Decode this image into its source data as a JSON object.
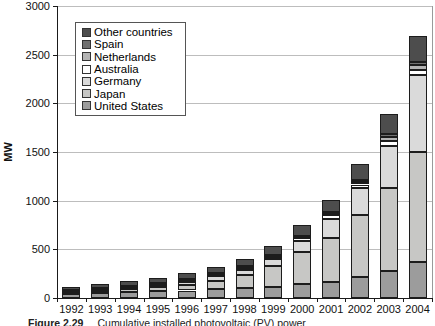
{
  "chart_data": {
    "type": "bar",
    "variant": "stacked-vertical",
    "title": "",
    "xlabel": "",
    "ylabel": "MW",
    "ylim": [
      0,
      3000
    ],
    "yticks": [
      0,
      500,
      1000,
      1500,
      2000,
      2500,
      3000
    ],
    "grid": "horizontal",
    "categories": [
      "1992",
      "1993",
      "1994",
      "1995",
      "1996",
      "1997",
      "1998",
      "1999",
      "2000",
      "2001",
      "2002",
      "2003",
      "2004"
    ],
    "series": [
      {
        "name": "United States",
        "color": "#9c9c9c",
        "values": [
          44,
          50,
          58,
          67,
          77,
          88,
          100,
          117,
          139,
          168,
          212,
          275,
          365
        ]
      },
      {
        "name": "Japan",
        "color": "#c7c7c5",
        "values": [
          19,
          24,
          31,
          43,
          60,
          91,
          133,
          209,
          330,
          453,
          637,
          860,
          1132
        ]
      },
      {
        "name": "Germany",
        "color": "#dadada",
        "values": [
          6,
          9,
          12,
          18,
          28,
          42,
          54,
          70,
          114,
          195,
          278,
          431,
          794
        ]
      },
      {
        "name": "Australia",
        "color": "#ffffff",
        "values": [
          7,
          9,
          11,
          13,
          16,
          19,
          23,
          25,
          29,
          34,
          39,
          46,
          52
        ]
      },
      {
        "name": "Netherlands",
        "color": "#b3b3b3",
        "values": [
          1,
          2,
          2,
          2,
          3,
          4,
          7,
          9,
          13,
          21,
          26,
          46,
          49
        ]
      },
      {
        "name": "Spain",
        "color": "#707070",
        "values": [
          4,
          5,
          6,
          7,
          8,
          9,
          10,
          11,
          12,
          16,
          21,
          27,
          37
        ]
      },
      {
        "name": "Other countries",
        "color": "#4d4d4d",
        "values": [
          33,
          40,
          54,
          60,
          64,
          65,
          75,
          89,
          111,
          123,
          165,
          205,
          260
        ]
      }
    ],
    "totals": [
      114,
      139,
      174,
      210,
      256,
      318,
      402,
      530,
      748,
      1010,
      1378,
      1890,
      2689
    ],
    "legend": {
      "position": "upper-left",
      "entries_top_to_bottom": [
        "Other countries",
        "Spain",
        "Netherlands",
        "Australia",
        "Germany",
        "Japan",
        "United States"
      ]
    }
  },
  "caption": {
    "figure_label": "Figure 2.29",
    "text": "Cumulative installed photovoltaic (PV) power"
  }
}
